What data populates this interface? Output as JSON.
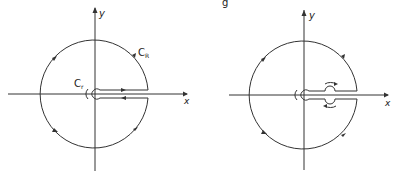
{
  "figure": {
    "caption_fragment": "g",
    "left_panel": {
      "axis_x_label": "x",
      "axis_y_label": "y",
      "outer_contour_label": "C",
      "outer_contour_subscript": "R",
      "inner_contour_label": "C",
      "inner_contour_subscript": "r",
      "description": "Keyhole contour with branch cut along positive real axis"
    },
    "right_panel": {
      "axis_x_label": "x",
      "axis_y_label": "y",
      "description": "Keyhole contour with additional indentation around a pole on the positive real axis"
    },
    "colors": {
      "stroke": "#333333",
      "background": "#ffffff"
    }
  }
}
